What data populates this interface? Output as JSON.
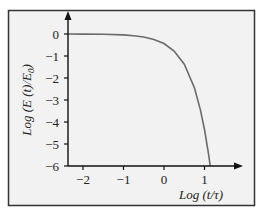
{
  "chart_data": {
    "type": "line",
    "title": "",
    "xlabel": "Log (t/τ)",
    "ylabel": "Log (E (t)/E0)",
    "ylabel_parts": {
      "main": "Log (E (t)/E",
      "sub": "0",
      "close": ")"
    },
    "xlim": [
      -2.4,
      1.9
    ],
    "ylim": [
      -6,
      0.9
    ],
    "x_ticks": [
      -2,
      -1,
      0,
      1
    ],
    "x_tick_labels": [
      "−2",
      "−1",
      "0",
      "1"
    ],
    "y_ticks": [
      0,
      -1,
      -2,
      -3,
      -4,
      -5,
      -6
    ],
    "y_tick_labels": [
      "0",
      "−1",
      "−2",
      "−3",
      "−4",
      "−5",
      "−6"
    ],
    "grid": false,
    "legend": null,
    "series": [
      {
        "name": "Log(E(t)/E0)",
        "x": [
          -2.4,
          -2.0,
          -1.5,
          -1.0,
          -0.75,
          -0.5,
          -0.25,
          0.0,
          0.25,
          0.5,
          0.75,
          0.9,
          1.0,
          1.1,
          1.14
        ],
        "y": [
          -0.002,
          -0.004,
          -0.014,
          -0.043,
          -0.077,
          -0.137,
          -0.244,
          -0.434,
          -0.772,
          -1.373,
          -2.442,
          -3.449,
          -4.343,
          -5.467,
          -6.0
        ]
      }
    ]
  },
  "colors": {
    "background": "#ffffff",
    "panel": "#f2f2f2",
    "frame": "#333333",
    "axis": "#111111",
    "curve": "#6b6b6b"
  }
}
